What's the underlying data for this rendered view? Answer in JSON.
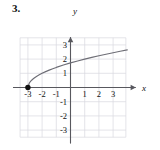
{
  "problem": {
    "number": "3."
  },
  "chart_data": {
    "type": "line",
    "title": "",
    "xlabel": "x",
    "ylabel": "y",
    "xlim": [
      -4.1,
      4.6
    ],
    "ylim": [
      -4.1,
      3.6
    ],
    "grid": true,
    "grid_step": 1,
    "grid_color": "#d9d9e0",
    "axis_color": "#58585e",
    "curve_color": "#6e6e76",
    "legend": "none",
    "x_tick_labels": [
      "-3",
      "-2",
      "-1",
      "1",
      "2",
      "3"
    ],
    "x_tick_values": [
      -3,
      -2,
      -1,
      1,
      2,
      3
    ],
    "y_tick_labels": [
      "3",
      "2",
      "1",
      "-1",
      "-2",
      "-3"
    ],
    "y_tick_values": [
      3,
      2,
      1,
      -1,
      -2,
      -3
    ],
    "series": [
      {
        "name": "y = sqrt(x + 3)",
        "points": [
          [
            -3,
            0
          ],
          [
            -2.9,
            0.316
          ],
          [
            -2.8,
            0.447
          ],
          [
            -2.7,
            0.548
          ],
          [
            -2.6,
            0.632
          ],
          [
            -2.5,
            0.707
          ],
          [
            -2.4,
            0.775
          ],
          [
            -2.2,
            0.894
          ],
          [
            -2,
            1
          ],
          [
            -1.75,
            1.118
          ],
          [
            -1.5,
            1.225
          ],
          [
            -1.25,
            1.323
          ],
          [
            -1,
            1.414
          ],
          [
            -0.5,
            1.581
          ],
          [
            0,
            1.732
          ],
          [
            0.5,
            1.871
          ],
          [
            1,
            2
          ],
          [
            1.5,
            2.121
          ],
          [
            2,
            2.236
          ],
          [
            2.5,
            2.345
          ],
          [
            3,
            2.449
          ],
          [
            3.5,
            2.55
          ],
          [
            4,
            2.646
          ]
        ]
      }
    ],
    "annotations": [
      {
        "name": "closed-endpoint",
        "kind": "filled-dot",
        "x": -3,
        "y": 0
      }
    ]
  },
  "axes": {
    "x_axis_arrow_label": "x",
    "y_axis_arrow_label": "y"
  }
}
